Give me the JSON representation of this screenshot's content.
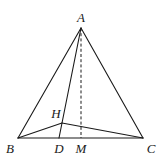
{
  "diagram": {
    "type": "geometry-pyramid",
    "stroke_color": "#1a1a1a",
    "background": "#ffffff",
    "points": {
      "A": {
        "label": "A",
        "x": 81,
        "y": 28,
        "lx": 81,
        "ly": 22
      },
      "B": {
        "label": "B",
        "x": 18,
        "y": 138,
        "lx": 10,
        "ly": 153
      },
      "C": {
        "label": "C",
        "x": 143,
        "y": 138,
        "lx": 151,
        "ly": 153
      },
      "H": {
        "label": "H",
        "x": 62,
        "y": 123,
        "lx": 56,
        "ly": 118
      },
      "D": {
        "label": "D",
        "x": 59,
        "y": 138,
        "lx": 59,
        "ly": 153
      },
      "M": {
        "label": "M",
        "x": 81,
        "y": 138,
        "lx": 81,
        "ly": 153
      }
    },
    "solid_segments": [
      [
        "A",
        "B"
      ],
      [
        "A",
        "C"
      ],
      [
        "B",
        "C"
      ],
      [
        "A",
        "D"
      ],
      [
        "B",
        "H"
      ],
      [
        "H",
        "C"
      ]
    ],
    "dashed_segments": [
      [
        "A",
        "M"
      ]
    ]
  }
}
